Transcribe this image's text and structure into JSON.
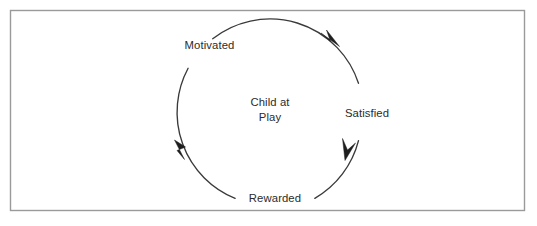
{
  "diagram": {
    "type": "cycle",
    "direction": "clockwise",
    "frame": {
      "name": "diagram-border",
      "border_color": "#9a9a9a",
      "background_color": "#ffffff"
    },
    "center": {
      "line1": "Child at",
      "line2": "Play"
    },
    "stages": [
      {
        "id": "motivated",
        "label": "Motivated",
        "position": "upper-left"
      },
      {
        "id": "satisfied",
        "label": "Satisfied",
        "position": "right"
      },
      {
        "id": "rewarded",
        "label": "Rewarded",
        "position": "bottom"
      }
    ],
    "colors": {
      "arc": "#3a3a3a",
      "arrow": "#1e1e1e",
      "text": "#2b2b2b",
      "border": "#9a9a9a",
      "background": "#ffffff"
    }
  }
}
